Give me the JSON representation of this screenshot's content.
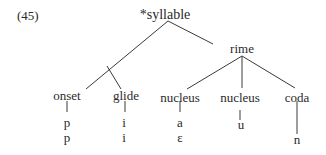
{
  "example_number": "(45)",
  "tree": {
    "root": "*syllable",
    "rime": "rime",
    "constituents": [
      {
        "label": "onset",
        "segments": [
          "p",
          "p"
        ]
      },
      {
        "label": "glide",
        "segments": [
          "i",
          "i"
        ]
      },
      {
        "label": "nucleus",
        "segments": [
          "a",
          "ε"
        ]
      },
      {
        "label": "nucleus",
        "segments": [
          "u",
          ""
        ]
      },
      {
        "label": "coda",
        "segments": [
          "",
          "n"
        ]
      }
    ]
  }
}
